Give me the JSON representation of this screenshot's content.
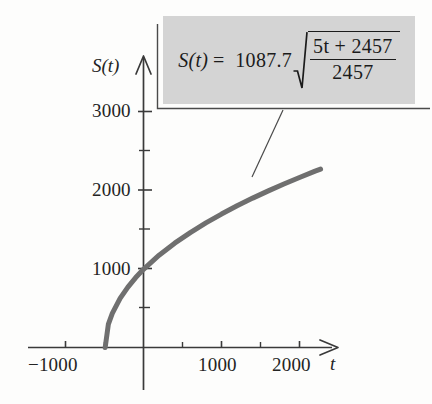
{
  "figure": {
    "title": "",
    "background_color": "#fdfdfc"
  },
  "chart_data": {
    "type": "line",
    "title": "",
    "xlabel": "t",
    "ylabel": "S(t)",
    "xlim": [
      -1500,
      2450
    ],
    "ylim": [
      -600,
      3350
    ],
    "grid": false,
    "legend": null,
    "x_ticks_major": [
      -1000,
      1000,
      2000
    ],
    "x_tick_labels": [
      "−1000",
      "1000",
      "2000"
    ],
    "x_ticks_minor": [
      -500,
      500,
      1500,
      2500
    ],
    "y_ticks_major": [
      1000,
      2000,
      3000
    ],
    "y_tick_labels": [
      "1000",
      "2000",
      "3000"
    ],
    "y_ticks_minor": [
      500,
      1500,
      2500
    ],
    "series": [
      {
        "name": "S(t)",
        "color": "#6f6f6f",
        "line_width": 5,
        "equation": "S(t) = 1087.7 * sqrt((5t + 2457)/2457)",
        "domain": [
          -491.4,
          2270
        ],
        "x": [
          -491.4,
          -450,
          -400,
          -300,
          -200,
          -100,
          0,
          200,
          400,
          600,
          800,
          1000,
          1200,
          1400,
          1600,
          1800,
          2000,
          2200,
          2270
        ],
        "y": [
          0,
          299,
          434,
          625,
          770,
          891,
          996,
          1176,
          1329,
          1464,
          1587,
          1700,
          1805,
          1903,
          1995,
          2083,
          2166,
          2246,
          2272
        ]
      }
    ],
    "annotations": [
      {
        "name": "equation-callout",
        "text": "S(t) = 1087.7 sqrt((5t + 2457)/2457)",
        "background_color": "#d4d4d4",
        "leader_from": [
          282,
          110
        ],
        "leader_to": [
          252,
          176
        ]
      }
    ]
  },
  "axes": {
    "x_axis_label": "t",
    "y_axis_label": "S(t)",
    "x_tick_labels": [
      {
        "value": "−1000"
      },
      {
        "value": "1000"
      },
      {
        "value": "2000"
      }
    ],
    "y_tick_labels": [
      {
        "value": "3000"
      },
      {
        "value": "2000"
      },
      {
        "value": "1000"
      }
    ],
    "axis_color": "#3a3a3a"
  },
  "equation": {
    "lhs": "S(t)",
    "equals": "=",
    "coefficient": "1087.7",
    "radical_symbol": "√",
    "numerator": "5t + 2457",
    "denominator": "2457",
    "numerator_parts": {
      "five": "5",
      "t": "t",
      "plus": "+",
      "constant": "2457"
    }
  },
  "colors": {
    "curve": "#6f6f6f",
    "callout_fill": "#d4d4d4",
    "ink": "#242424",
    "axis": "#3a3a3a"
  }
}
